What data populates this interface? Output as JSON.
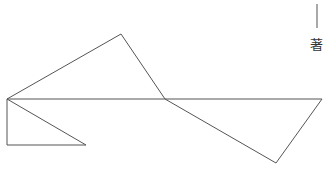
{
  "diagram": {
    "stroke_color": "#555555",
    "stroke_width": 1,
    "marker": {
      "line": {
        "x1": 317,
        "y1": 4,
        "x2": 317,
        "y2": 28
      },
      "label": "著",
      "label_x": 310,
      "label_y": 38
    },
    "segments": [
      {
        "id": "left-to-peak",
        "x1": 7,
        "y1": 99,
        "x2": 121,
        "y2": 34
      },
      {
        "id": "peak-to-middle",
        "x1": 121,
        "y1": 34,
        "x2": 165,
        "y2": 99
      },
      {
        "id": "horizontal-baseline",
        "x1": 7,
        "y1": 99,
        "x2": 322,
        "y2": 99
      },
      {
        "id": "middle-to-bottom-right",
        "x1": 165,
        "y1": 99,
        "x2": 276,
        "y2": 163
      },
      {
        "id": "bottom-right-to-right",
        "x1": 276,
        "y1": 163,
        "x2": 322,
        "y2": 99
      },
      {
        "id": "left-vertical",
        "x1": 7,
        "y1": 99,
        "x2": 7,
        "y2": 145
      },
      {
        "id": "left-bottom-horizontal",
        "x1": 7,
        "y1": 145,
        "x2": 86,
        "y2": 145
      },
      {
        "id": "left-diagonal",
        "x1": 7,
        "y1": 99,
        "x2": 86,
        "y2": 145
      }
    ]
  }
}
